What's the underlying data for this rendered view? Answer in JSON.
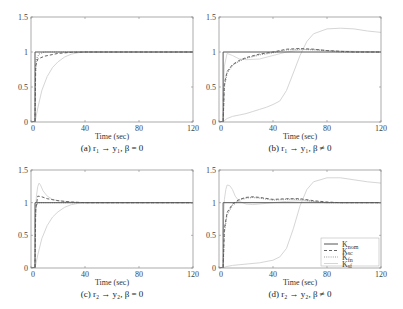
{
  "chart_data": [
    {
      "type": "line",
      "id": "a",
      "caption": "(a) r₁ → y₁, β = 0",
      "xlabel": "Time (sec)",
      "ylabel": "",
      "xlim": [
        0,
        120
      ],
      "ylim": [
        0,
        1.5
      ],
      "xticks": [
        0,
        40,
        80,
        120
      ],
      "yticks": [
        0,
        0.5,
        1,
        1.5
      ],
      "grid": false,
      "series": [
        {
          "name": "K_nom",
          "x": [
            0,
            3,
            3,
            120
          ],
          "y": [
            0,
            0,
            1,
            1
          ]
        },
        {
          "name": "K_sc",
          "x": [
            0,
            3,
            3.5,
            5,
            10,
            20,
            30,
            40,
            120
          ],
          "y": [
            0,
            0,
            0.8,
            0.9,
            0.94,
            0.98,
            0.995,
            1,
            1
          ]
        },
        {
          "name": "K_fn",
          "x": [
            0,
            3,
            3.3,
            4,
            6,
            10,
            120
          ],
          "y": [
            0,
            0,
            0.7,
            0.9,
            0.97,
            1,
            1
          ]
        },
        {
          "name": "K_sf",
          "x": [
            0,
            3,
            5,
            8,
            12,
            16,
            20,
            25,
            30,
            35,
            40,
            120
          ],
          "y": [
            0,
            0,
            0.2,
            0.45,
            0.65,
            0.78,
            0.86,
            0.93,
            0.97,
            0.99,
            1,
            1
          ]
        }
      ]
    },
    {
      "type": "line",
      "id": "b",
      "caption": "(b) r₁ → y₁, β ≠ 0",
      "xlabel": "Time (sec)",
      "ylabel": "",
      "xlim": [
        0,
        120
      ],
      "ylim": [
        0,
        1.5
      ],
      "xticks": [
        0,
        40,
        80,
        120
      ],
      "yticks": [
        0,
        0.5,
        1,
        1.5
      ],
      "grid": false,
      "series": [
        {
          "name": "K_nom",
          "x": [
            0,
            3,
            3,
            120
          ],
          "y": [
            0,
            0,
            1,
            1
          ]
        },
        {
          "name": "K_sc",
          "x": [
            0,
            3,
            4,
            6,
            10,
            15,
            20,
            30,
            40,
            50,
            60,
            70,
            80,
            90,
            100,
            120
          ],
          "y": [
            0,
            0,
            0.55,
            0.72,
            0.82,
            0.88,
            0.92,
            0.97,
            1.0,
            1.04,
            1.05,
            1.04,
            1.02,
            1.01,
            1.0,
            1.0
          ]
        },
        {
          "name": "K_fn",
          "x": [
            0,
            3,
            4,
            6,
            10,
            15,
            20,
            30,
            40,
            50,
            60,
            70,
            80,
            90,
            100,
            120
          ],
          "y": [
            0,
            0,
            0.5,
            0.7,
            0.81,
            0.87,
            0.91,
            0.96,
            0.99,
            1.03,
            1.04,
            1.03,
            1.02,
            1.0,
            1.0,
            1.0
          ]
        },
        {
          "name": "K_sf",
          "x": [
            0,
            3,
            4,
            6,
            10,
            15,
            20,
            25,
            30,
            35,
            40,
            45,
            50,
            55,
            60,
            65,
            70,
            80,
            90,
            100,
            110,
            120
          ],
          "y": [
            0,
            0,
            0.02,
            0.05,
            0.08,
            0.1,
            0.12,
            0.15,
            0.18,
            0.21,
            0.25,
            0.3,
            0.45,
            0.7,
            0.95,
            1.15,
            1.26,
            1.33,
            1.34,
            1.33,
            1.3,
            1.28
          ]
        },
        {
          "name": "K_sf_b",
          "x": [
            3,
            4,
            6,
            10,
            15,
            20,
            30,
            40,
            50,
            60,
            70,
            80,
            120
          ],
          "y": [
            0.3,
            0.8,
            0.98,
            0.95,
            0.9,
            0.89,
            0.9,
            0.95,
            1.0,
            1.03,
            1.04,
            1.02,
            1.0
          ]
        }
      ]
    },
    {
      "type": "line",
      "id": "c",
      "caption": "(c) r₂ → y₂, β = 0",
      "xlabel": "Time (sec)",
      "ylabel": "",
      "xlim": [
        0,
        120
      ],
      "ylim": [
        0,
        1.5
      ],
      "xticks": [
        0,
        40,
        80,
        120
      ],
      "yticks": [
        0,
        0.5,
        1,
        1.5
      ],
      "grid": false,
      "series": [
        {
          "name": "K_nom",
          "x": [
            0,
            3,
            3,
            120
          ],
          "y": [
            0,
            0,
            1,
            1
          ]
        },
        {
          "name": "K_sc",
          "x": [
            0,
            3,
            3.5,
            5,
            8,
            12,
            20,
            30,
            40,
            120
          ],
          "y": [
            0,
            0,
            0.9,
            1.1,
            1.09,
            1.06,
            1.03,
            1.01,
            1.0,
            1.0
          ]
        },
        {
          "name": "K_fn",
          "x": [
            0,
            3,
            3.3,
            4,
            6,
            10,
            120
          ],
          "y": [
            0,
            0,
            0.8,
            0.97,
            1.0,
            1.0,
            1.0
          ]
        },
        {
          "name": "K_sf",
          "x": [
            0,
            3,
            5,
            8,
            12,
            16,
            20,
            25,
            30,
            35,
            40,
            120
          ],
          "y": [
            0,
            0,
            0.2,
            0.45,
            0.65,
            0.78,
            0.86,
            0.93,
            0.97,
            0.99,
            1,
            1
          ]
        },
        {
          "name": "K_sf_peak",
          "x": [
            3,
            4,
            5,
            6,
            7,
            9,
            12,
            16,
            20,
            30,
            40,
            120
          ],
          "y": [
            0.6,
            1.1,
            1.25,
            1.3,
            1.27,
            1.18,
            1.1,
            1.05,
            1.03,
            1.01,
            1.0,
            1.0
          ]
        }
      ]
    },
    {
      "type": "line",
      "id": "d",
      "caption": "(d) r₂ → y₂, β ≠ 0",
      "xlabel": "Time (sec)",
      "ylabel": "",
      "xlim": [
        0,
        120
      ],
      "ylim": [
        0,
        1.5
      ],
      "xticks": [
        0,
        40,
        80,
        120
      ],
      "yticks": [
        0,
        0.5,
        1,
        1.5
      ],
      "grid": false,
      "legend": {
        "position": "lower right",
        "entries": [
          {
            "name": "K_nom",
            "label_main": "K",
            "label_sub": "nom",
            "style": "solid"
          },
          {
            "name": "K_sc",
            "label_main": "K",
            "label_sub": "sc",
            "style": "dashed"
          },
          {
            "name": "K_fn",
            "label_main": "K",
            "label_sub": "fn",
            "style": "dotted"
          },
          {
            "name": "K_sf",
            "label_main": "K",
            "label_sub": "sf",
            "style": "light"
          }
        ]
      },
      "series": [
        {
          "name": "K_nom",
          "x": [
            0,
            3,
            3,
            120
          ],
          "y": [
            0,
            0,
            1,
            1
          ]
        },
        {
          "name": "K_sc",
          "x": [
            0,
            3,
            4,
            6,
            10,
            15,
            20,
            25,
            30,
            40,
            50,
            60,
            70,
            80,
            90,
            100,
            120
          ],
          "y": [
            0,
            0,
            0.6,
            0.85,
            0.98,
            1.05,
            1.08,
            1.09,
            1.08,
            1.05,
            1.06,
            1.06,
            1.03,
            1.01,
            1.0,
            1.0,
            1.0
          ]
        },
        {
          "name": "K_fn",
          "x": [
            0,
            3,
            4,
            6,
            10,
            15,
            20,
            25,
            30,
            40,
            50,
            60,
            70,
            80,
            90,
            100,
            120
          ],
          "y": [
            0,
            0,
            0.55,
            0.82,
            0.96,
            1.04,
            1.07,
            1.08,
            1.07,
            1.04,
            1.05,
            1.05,
            1.02,
            1.0,
            1.0,
            1.0,
            1.0
          ]
        },
        {
          "name": "K_sf",
          "x": [
            0,
            3,
            5,
            10,
            20,
            30,
            40,
            45,
            50,
            55,
            60,
            65,
            70,
            80,
            90,
            100,
            110,
            120
          ],
          "y": [
            0,
            0,
            0.02,
            0.04,
            0.06,
            0.08,
            0.12,
            0.17,
            0.3,
            0.6,
            0.95,
            1.2,
            1.32,
            1.38,
            1.38,
            1.35,
            1.32,
            1.3
          ]
        },
        {
          "name": "K_sf_peak",
          "x": [
            3,
            4,
            5,
            6,
            8,
            10,
            12,
            15,
            20,
            25,
            30,
            40,
            50,
            60,
            70,
            80,
            120
          ],
          "y": [
            0.5,
            1.05,
            1.2,
            1.27,
            1.26,
            1.2,
            1.1,
            1.02,
            0.98,
            0.97,
            0.98,
            1.0,
            1.02,
            1.03,
            1.02,
            1.0,
            1.0
          ]
        }
      ]
    }
  ],
  "layout": {
    "panels": [
      {
        "id": "a",
        "left": 31,
        "top": 17,
        "right": 193,
        "bottom": 122
      },
      {
        "id": "b",
        "left": 219,
        "top": 17,
        "right": 381,
        "bottom": 122
      },
      {
        "id": "c",
        "left": 31,
        "top": 170,
        "right": 193,
        "bottom": 268
      },
      {
        "id": "d",
        "left": 219,
        "top": 170,
        "right": 381,
        "bottom": 268
      }
    ]
  },
  "styles": {
    "K_nom": {
      "color": "#555555",
      "width": 1.0,
      "dash": ""
    },
    "K_sc": {
      "color": "#666666",
      "width": 1.0,
      "dash": "3,2"
    },
    "K_fn": {
      "color": "#999999",
      "width": 1.2,
      "dash": "1,1.2"
    },
    "K_sf": {
      "color": "#d6d6d6",
      "width": 1.0,
      "dash": ""
    },
    "K_sf_b": {
      "color": "#cfcfcf",
      "width": 0.8,
      "dash": ""
    },
    "K_sf_peak": {
      "color": "#d8d8d8",
      "width": 1.0,
      "dash": ""
    },
    "axis": "#888888"
  }
}
